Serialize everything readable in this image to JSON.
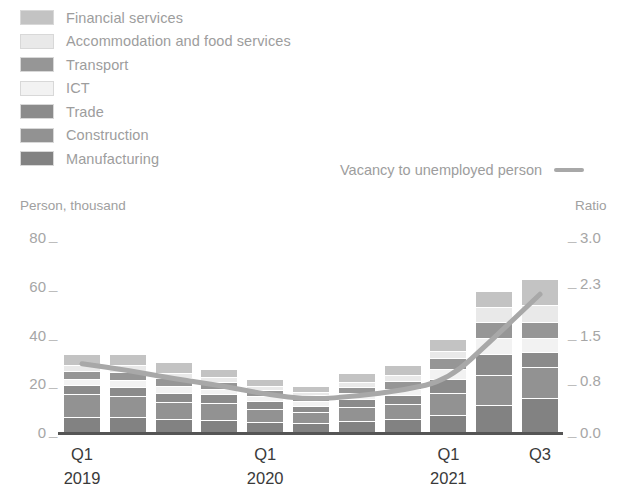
{
  "legend": {
    "categories": [
      {
        "label": "Financial services",
        "color": "#c3c3c3",
        "key": "financial_services"
      },
      {
        "label": "Accommodation and food services",
        "color": "#e9e9e9",
        "key": "accommodation_food"
      },
      {
        "label": "Transport",
        "color": "#969696",
        "key": "transport"
      },
      {
        "label": "ICT",
        "color": "#f2f2f2",
        "key": "ict"
      },
      {
        "label": "Trade",
        "color": "#8b8b8b",
        "key": "trade"
      },
      {
        "label": "Construction",
        "color": "#929292",
        "key": "construction"
      },
      {
        "label": "Manufacturing",
        "color": "#828282",
        "key": "manufacturing"
      }
    ],
    "line_series": {
      "label": "Vacancy to unemployed person",
      "color": "#a8a8a8"
    }
  },
  "axes": {
    "left_caption": "Person, thousand",
    "right_caption": "Ratio",
    "left_ticks": [
      "0",
      "20",
      "40",
      "60",
      "80"
    ],
    "right_ticks": [
      "0.0",
      "0.8",
      "1.5",
      "2.3",
      "3.0"
    ],
    "tick_dash": "_"
  },
  "xaxis": {
    "groups": [
      {
        "quarter": "Q1",
        "year": "2019"
      },
      {
        "quarter": "Q1",
        "year": "2020"
      },
      {
        "quarter": "Q1",
        "year": "2021"
      },
      {
        "quarter": "Q3",
        "year": ""
      }
    ]
  },
  "chart_data": {
    "type": "bar",
    "title": "",
    "subtitle": "",
    "xlabel": "",
    "ylabel": "Person, thousand",
    "y2label": "Ratio",
    "ylim": [
      0,
      80
    ],
    "y2lim": [
      0.0,
      3.0
    ],
    "yticks": [
      0,
      20,
      40,
      60,
      80
    ],
    "y2ticks": [
      0.0,
      0.8,
      1.5,
      2.3,
      3.0
    ],
    "grid": false,
    "legend_position": "top-left",
    "stacked": true,
    "categories": [
      "Q1 2019",
      "Q2 2019",
      "Q3 2019",
      "Q4 2019",
      "Q1 2020",
      "Q2 2020",
      "Q3 2020",
      "Q4 2020",
      "Q1 2021",
      "Q2 2021",
      "Q3 2021"
    ],
    "stack_order_bottom_to_top": [
      "Manufacturing",
      "Construction",
      "Trade",
      "ICT",
      "Transport",
      "Accommodation and food services",
      "Financial services"
    ],
    "series": [
      {
        "name": "Manufacturing",
        "color": "#828282",
        "values": [
          6.0,
          6.2,
          5.2,
          5.0,
          4.2,
          3.6,
          4.6,
          5.2,
          6.8,
          11.0,
          13.8
        ]
      },
      {
        "name": "Construction",
        "color": "#929292",
        "values": [
          9.4,
          8.4,
          7.2,
          6.8,
          5.4,
          4.6,
          5.6,
          6.2,
          9.2,
          12.4,
          13.0
        ]
      },
      {
        "name": "Trade",
        "color": "#8b8b8b",
        "values": [
          3.8,
          4.0,
          3.8,
          3.6,
          3.0,
          2.6,
          3.2,
          3.6,
          5.6,
          8.6,
          6.0
        ]
      },
      {
        "name": "ICT",
        "color": "#f2f2f2",
        "values": [
          2.6,
          2.6,
          2.6,
          2.4,
          2.2,
          2.0,
          2.4,
          2.8,
          4.2,
          6.6,
          5.8
        ]
      },
      {
        "name": "Transport",
        "color": "#969696",
        "values": [
          3.4,
          3.6,
          3.4,
          2.8,
          2.4,
          2.2,
          2.8,
          3.2,
          4.4,
          6.4,
          6.6
        ]
      },
      {
        "name": "Accommodation and food services",
        "color": "#e9e9e9",
        "values": [
          2.4,
          2.6,
          2.2,
          1.8,
          1.6,
          1.4,
          2.0,
          2.4,
          3.2,
          6.2,
          7.0
        ]
      },
      {
        "name": "Financial services",
        "color": "#c3c3c3",
        "values": [
          4.2,
          4.4,
          4.4,
          3.6,
          3.0,
          2.6,
          3.6,
          4.0,
          4.8,
          6.6,
          10.6
        ]
      }
    ],
    "totals": [
      31.8,
      31.8,
      28.8,
      26.0,
      21.8,
      19.0,
      24.2,
      27.4,
      38.2,
      57.8,
      62.8
    ],
    "line_series": {
      "name": "Vacancy to unemployed person",
      "color": "#a8a8a8",
      "axis": "right",
      "unit": "ratio",
      "values": [
        1.05,
        0.98,
        0.86,
        0.78,
        0.62,
        0.52,
        0.5,
        0.58,
        0.66,
        0.78,
        1.22,
        2.1
      ],
      "values_by_quarter": [
        1.05,
        0.95,
        0.82,
        0.72,
        0.58,
        0.5,
        0.55,
        0.64,
        0.8,
        1.45,
        2.12
      ]
    }
  }
}
